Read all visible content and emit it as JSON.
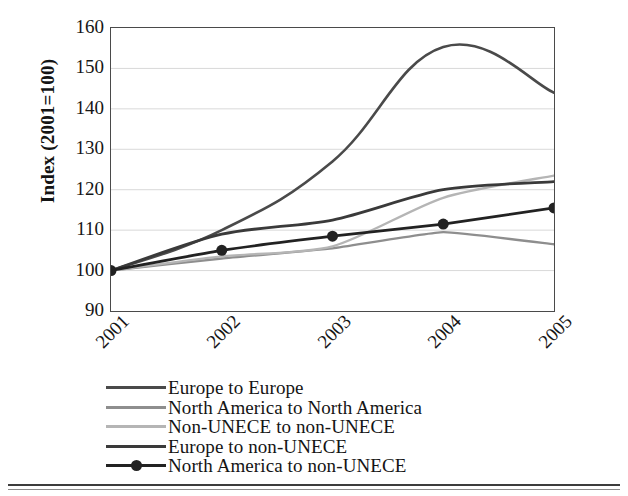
{
  "chart_data": {
    "type": "line",
    "title": "",
    "subtitle": "",
    "xlabel": "",
    "ylabel": "Index (2001=100)",
    "categories": [
      "2001",
      "2002",
      "2003",
      "2004",
      "2005"
    ],
    "x": [
      2001,
      2002,
      2003,
      2004,
      2005
    ],
    "ylim": [
      90,
      160
    ],
    "yticks": [
      160,
      150,
      140,
      130,
      120,
      110,
      100,
      90
    ],
    "ytick_labels": [
      "160",
      "150",
      "140",
      "130",
      "120",
      "110",
      "100",
      "90"
    ],
    "grid": true,
    "grid_axis": "y",
    "legend_position": "below",
    "smooth": true,
    "series": [
      {
        "name": "Europe to Europe",
        "values": [
          100,
          110,
          127,
          155.3,
          144
        ],
        "color": "#4a4a4a",
        "width": 2.6,
        "marker": "none"
      },
      {
        "name": "North America to North America",
        "values": [
          100,
          103,
          105.5,
          109.5,
          106.5
        ],
        "color": "#8e8e8e",
        "width": 2.4,
        "marker": "none"
      },
      {
        "name": "Non-UNECE to non-UNECE",
        "values": [
          100,
          103.5,
          106,
          118,
          123.5
        ],
        "color": "#b5b5b5",
        "width": 2.4,
        "marker": "none"
      },
      {
        "name": "Europe to non-UNECE",
        "values": [
          100,
          109,
          112.5,
          120,
          122
        ],
        "color": "#3a3a3a",
        "width": 2.8,
        "marker": "none"
      },
      {
        "name": "North America to non-UNECE",
        "values": [
          100,
          105,
          108.5,
          111.5,
          115.5
        ],
        "color": "#222222",
        "width": 2.8,
        "marker": "circle",
        "marker_size": 11
      }
    ]
  },
  "axes": {
    "y_title": "Index (2001=100)",
    "y_tick_labels": [
      "160",
      "150",
      "140",
      "130",
      "120",
      "110",
      "100",
      "90"
    ],
    "x_tick_labels": [
      "2001",
      "2002",
      "2003",
      "2004",
      "2005"
    ]
  },
  "legend": {
    "items": [
      {
        "label": "Europe to Europe",
        "color": "#4a4a4a",
        "marker": "none"
      },
      {
        "label": "North America to North America",
        "color": "#8e8e8e",
        "marker": "none"
      },
      {
        "label": "Non-UNECE to non-UNECE",
        "color": "#b5b5b5",
        "marker": "none"
      },
      {
        "label": "Europe to non-UNECE",
        "color": "#3a3a3a",
        "marker": "none"
      },
      {
        "label": "North America to non-UNECE",
        "color": "#222222",
        "marker": "circle"
      }
    ]
  },
  "colors": {
    "frame": "#4a4a4a",
    "grid": "#d9d9d9",
    "text": "#161616",
    "background": "#ffffff"
  }
}
